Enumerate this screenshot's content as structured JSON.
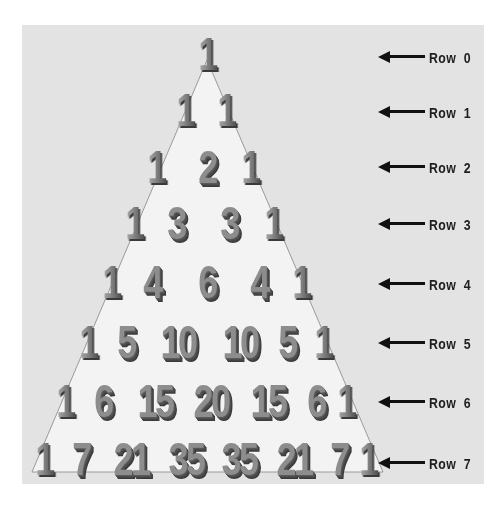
{
  "diagram": {
    "colors": {
      "background": "#ffffff",
      "panel": "#e3e3e3",
      "triangle_fill": "#f3f3f3",
      "triangle_edge": "#9a9a9a",
      "numeral_face": "#8d8d8d",
      "numeral_shadow": "#444444",
      "label_text": "#1e1e1e",
      "arrow": "#111111"
    },
    "rows": [
      {
        "label": "Row  0",
        "values": [
          "1"
        ]
      },
      {
        "label": "Row  1",
        "values": [
          "1",
          "1"
        ]
      },
      {
        "label": "Row  2",
        "values": [
          "1",
          "2",
          "1"
        ]
      },
      {
        "label": "Row  3",
        "values": [
          "1",
          "3",
          "3",
          "1"
        ]
      },
      {
        "label": "Row  4",
        "values": [
          "1",
          "4",
          "6",
          "4",
          "1"
        ]
      },
      {
        "label": "Row  5",
        "values": [
          "1",
          "5",
          "10",
          "10",
          "5",
          "1"
        ]
      },
      {
        "label": "Row  6",
        "values": [
          "1",
          "6",
          "15",
          "20",
          "15",
          "6",
          "1"
        ]
      },
      {
        "label": "Row  7",
        "values": [
          "1",
          "7",
          "21",
          "35",
          "35",
          "21",
          "7",
          "1"
        ]
      }
    ],
    "arrow_icon": "left-arrow-icon"
  }
}
